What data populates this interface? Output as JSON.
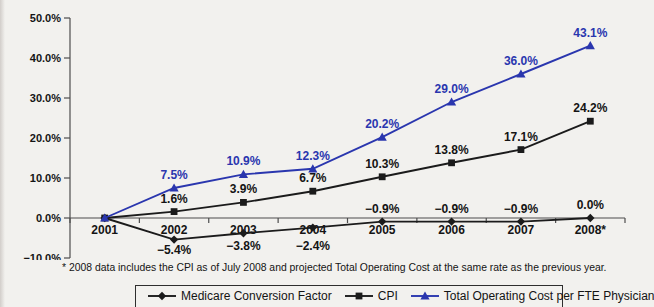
{
  "colors": {
    "background": "#f2f1ee",
    "axis": "#4d4d4d",
    "series_black": "#1b1b1b",
    "series_blue": "#2a36ae",
    "text": "#141414"
  },
  "footnote": "* 2008 data includes the CPI as of July 2008 and projected Total Operating Cost at the same rate as the previous year.",
  "legend": {
    "items": [
      {
        "label": "Medicare Conversion Factor",
        "marker": "diamond",
        "color": "#1b1b1b"
      },
      {
        "label": "CPI",
        "marker": "square",
        "color": "#1b1b1b"
      },
      {
        "label": "Total Operating Cost per FTE Physician",
        "marker": "triangle",
        "color": "#2a36ae"
      }
    ]
  },
  "chart_data": {
    "type": "line",
    "title": "",
    "xlabel": "",
    "ylabel": "",
    "categories": [
      "2001",
      "2002",
      "2003",
      "2004",
      "2005",
      "2006",
      "2007",
      "2008*"
    ],
    "series": [
      {
        "name": "Medicare Conversion Factor",
        "marker": "diamond",
        "color": "#1b1b1b",
        "values": [
          0.0,
          -5.4,
          -3.8,
          -2.4,
          -0.9,
          -0.9,
          -0.9,
          0.0
        ],
        "labels": [
          "",
          "−5.4%",
          "−3.8%",
          "−2.4%",
          "−0.9%",
          "−0.9%",
          "−0.9%",
          "0.0%"
        ],
        "label_side": [
          "",
          "below",
          "below",
          "below",
          "above",
          "above",
          "above",
          "above"
        ],
        "label_color": "#141414"
      },
      {
        "name": "CPI",
        "marker": "square",
        "color": "#1b1b1b",
        "values": [
          0.0,
          1.6,
          3.9,
          6.7,
          10.3,
          13.8,
          17.1,
          24.2
        ],
        "labels": [
          "",
          "1.6%",
          "3.9%",
          "6.7%",
          "10.3%",
          "13.8%",
          "17.1%",
          "24.2%"
        ],
        "label_side": [
          "",
          "above",
          "above",
          "above",
          "above",
          "above",
          "above",
          "above"
        ],
        "label_color": "#141414"
      },
      {
        "name": "Total Operating Cost per FTE Physician",
        "marker": "triangle",
        "color": "#2a36ae",
        "values": [
          0.0,
          7.5,
          10.9,
          12.3,
          20.2,
          29.0,
          36.0,
          43.1
        ],
        "labels": [
          "",
          "7.5%",
          "10.9%",
          "12.3%",
          "20.2%",
          "29.0%",
          "36.0%",
          "43.1%"
        ],
        "label_side": [
          "",
          "above",
          "above",
          "above",
          "above",
          "above",
          "above",
          "above"
        ],
        "label_color": "#2a36ae"
      }
    ],
    "ylim": [
      -10,
      50
    ],
    "ytick_step": 10,
    "ytick_labels": [
      "−10.0%",
      "0.0%",
      "10.0%",
      "20.0%",
      "30.0%",
      "40.0%",
      "50.0%"
    ],
    "grid": false,
    "legend_position": "bottom"
  }
}
